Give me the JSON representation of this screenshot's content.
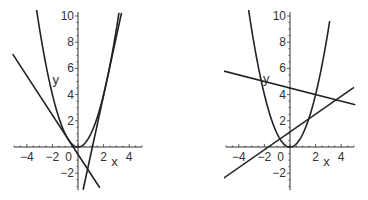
{
  "chart_data": [
    {
      "type": "line",
      "title": "",
      "xlabel": "x",
      "ylabel": "y",
      "xlim": [
        -5,
        5
      ],
      "ylim": [
        -3.3,
        10.3
      ],
      "grid": false,
      "legend": null,
      "x_ticks": [
        "-4",
        "-2",
        "0",
        "2",
        "4"
      ],
      "y_ticks": [
        "-2",
        "2",
        "4",
        "6",
        "8",
        "10"
      ],
      "series": [
        {
          "name": "parabola",
          "expr": "x^2",
          "kind": "quadratic",
          "a": 1,
          "b": 0,
          "c": 0,
          "x_range": [
            -3.5,
            3.2
          ]
        },
        {
          "name": "tangent-1",
          "expr": "-1.5x - 0.5625",
          "kind": "linear",
          "m": -1.5,
          "c": -0.5625,
          "x_range": [
            -5.1,
            1.7
          ]
        },
        {
          "name": "tangent-2",
          "expr": "4.5x - 5.0625",
          "kind": "linear",
          "m": 4.5,
          "c": -5.0625,
          "x_range": [
            0.4,
            3.4
          ]
        }
      ],
      "annotations": [
        "Two tangent lines to y = x^2 from the point (0.75, -1.69)"
      ],
      "origin_px": [
        78,
        147
      ]
    },
    {
      "type": "line",
      "title": "",
      "xlabel": "x",
      "ylabel": "y",
      "xlim": [
        -5,
        5
      ],
      "ylim": [
        -3.3,
        10.3
      ],
      "grid": false,
      "legend": null,
      "x_ticks": [
        "-4",
        "-2",
        "0",
        "2",
        "4"
      ],
      "y_ticks": [
        "-2",
        "2",
        "4",
        "6",
        "8",
        "10"
      ],
      "series": [
        {
          "name": "parabola",
          "expr": "x^2",
          "kind": "quadratic",
          "a": 1,
          "b": 0,
          "c": 0,
          "x_range": [
            -3.3,
            3.1
          ]
        },
        {
          "name": "secant-1",
          "expr": "-0.25x + 4.5",
          "kind": "linear",
          "m": -0.25,
          "c": 4.5,
          "x_range": [
            -5.2,
            5.1
          ]
        },
        {
          "name": "secant-2",
          "expr": "0.68x + 1.15",
          "kind": "linear",
          "m": 0.68,
          "c": 1.15,
          "x_range": [
            -5.2,
            5.0
          ]
        }
      ],
      "annotations": [
        "Two secant lines crossing y = x^2"
      ],
      "origin_px": [
        290,
        147
      ]
    }
  ]
}
